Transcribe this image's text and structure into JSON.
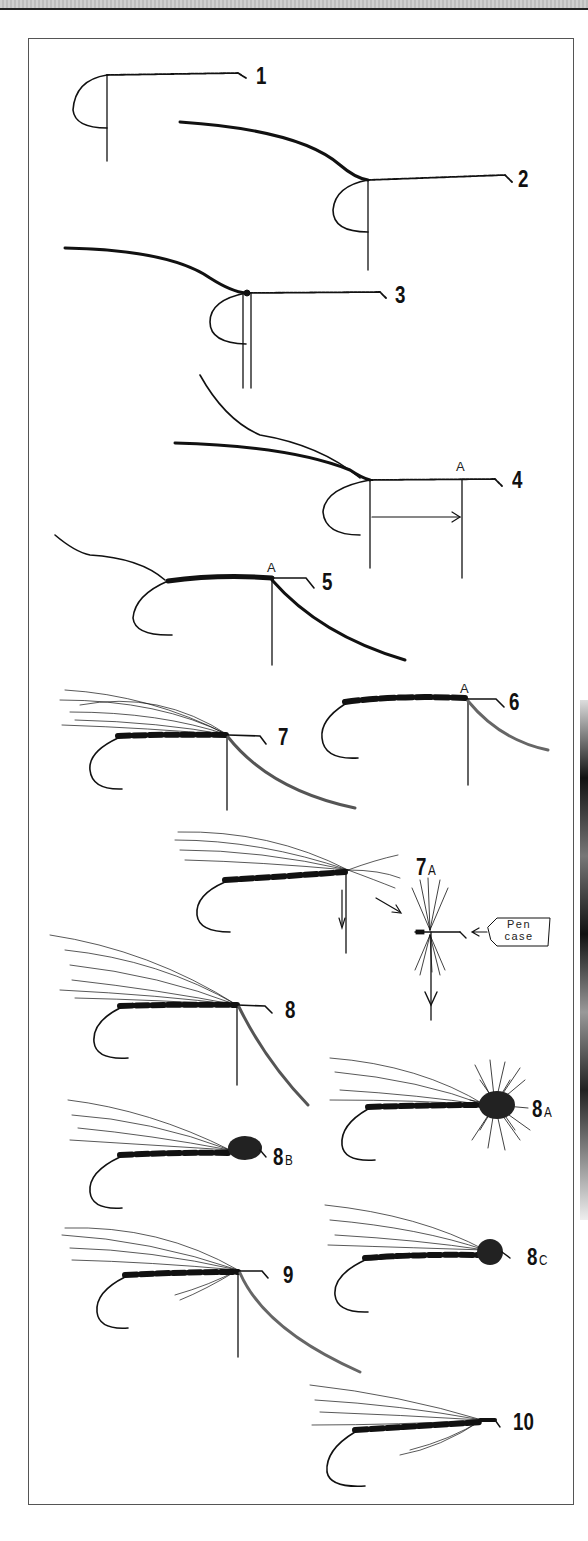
{
  "figure": {
    "type": "fly-tying step-by-step illustration",
    "steps": [
      {
        "label": "1",
        "sub": ""
      },
      {
        "label": "2",
        "sub": ""
      },
      {
        "label": "3",
        "sub": ""
      },
      {
        "label": "4",
        "sub": ""
      },
      {
        "label": "5",
        "sub": ""
      },
      {
        "label": "6",
        "sub": ""
      },
      {
        "label": "7",
        "sub": ""
      },
      {
        "label": "7",
        "sub": "A"
      },
      {
        "label": "8",
        "sub": ""
      },
      {
        "label": "8",
        "sub": "A"
      },
      {
        "label": "8",
        "sub": "B"
      },
      {
        "label": "8",
        "sub": "C"
      },
      {
        "label": "9",
        "sub": ""
      },
      {
        "label": "10",
        "sub": ""
      }
    ],
    "point_marker": "A",
    "pen_case_line1": "Pen",
    "pen_case_line2": "case"
  }
}
